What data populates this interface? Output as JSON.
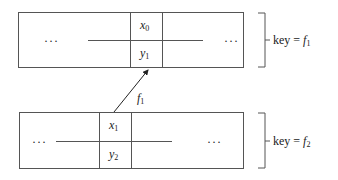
{
  "diagram": {
    "top_block": {
      "left_ellipsis": "···",
      "right_ellipsis": "···",
      "cell_top": {
        "var": "x",
        "sub": "0"
      },
      "cell_bottom": {
        "var": "y",
        "sub": "1"
      },
      "brace_label": {
        "text": "key = ",
        "var": "f",
        "sub": "1"
      }
    },
    "bottom_block": {
      "left_ellipsis": "···",
      "right_ellipsis": "···",
      "cell_top": {
        "var": "x",
        "sub": "1"
      },
      "cell_bottom": {
        "var": "y",
        "sub": "2"
      },
      "brace_label": {
        "text": "key = ",
        "var": "f",
        "sub": "2"
      }
    },
    "arrow": {
      "label_var": "f",
      "label_sub": "1"
    }
  }
}
